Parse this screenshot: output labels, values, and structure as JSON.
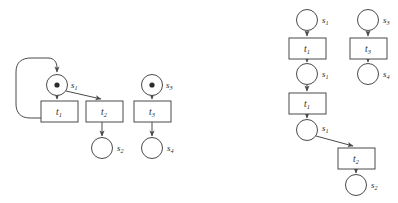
{
  "figure": {
    "name": "petri-net-and-unfolding",
    "background_color": "#ffffff",
    "line_color": "#4a4a4a",
    "text_color": "#2b2b2b",
    "width": 398,
    "height": 203
  },
  "left_net": {
    "name": "petri-net",
    "places": [
      {
        "id": "s1",
        "label": "s",
        "sub": "1",
        "cx": 57,
        "cy": 85,
        "r": 10.5,
        "tokens": 1,
        "label_x": 71,
        "label_y": 85
      },
      {
        "id": "s2",
        "label": "s",
        "sub": "2",
        "cx": 102,
        "cy": 148,
        "r": 10.5,
        "tokens": 0,
        "label_x": 117,
        "label_y": 148
      },
      {
        "id": "s3",
        "label": "s",
        "sub": "3",
        "cx": 152,
        "cy": 85,
        "r": 10.5,
        "tokens": 1,
        "label_x": 166,
        "label_y": 85
      },
      {
        "id": "s4",
        "label": "s",
        "sub": "4",
        "cx": 152,
        "cy": 148,
        "r": 10.5,
        "tokens": 0,
        "label_x": 167,
        "label_y": 148
      }
    ],
    "transitions": [
      {
        "id": "t1",
        "label": "t",
        "sub": "1",
        "x": 41,
        "y": 101,
        "w": 37,
        "h": 21
      },
      {
        "id": "t2",
        "label": "t",
        "sub": "2",
        "x": 86,
        "y": 101,
        "w": 37,
        "h": 21
      },
      {
        "id": "t3",
        "label": "t",
        "sub": "3",
        "x": 134,
        "y": 101,
        "w": 37,
        "h": 21
      }
    ],
    "arcs": [
      {
        "from": "s1",
        "to": "t1",
        "kind": "straight"
      },
      {
        "from": "s1",
        "to": "t2",
        "kind": "diagonal"
      },
      {
        "from": "t1",
        "to": "s1",
        "kind": "feedback-loop"
      },
      {
        "from": "t2",
        "to": "s2",
        "kind": "straight"
      },
      {
        "from": "s3",
        "to": "t3",
        "kind": "straight"
      },
      {
        "from": "t3",
        "to": "s4",
        "kind": "straight"
      }
    ]
  },
  "right_net": {
    "name": "unfolding-occurrence-net",
    "places": [
      {
        "id": "u_s1_a",
        "label": "s",
        "sub": "1",
        "cx": 307,
        "cy": 20,
        "r": 10.5,
        "tokens": 0,
        "label_x": 322,
        "label_y": 20
      },
      {
        "id": "u_s3",
        "label": "s",
        "sub": "3",
        "cx": 368,
        "cy": 20,
        "r": 10.5,
        "tokens": 0,
        "label_x": 383,
        "label_y": 20
      },
      {
        "id": "u_s1_b",
        "label": "s",
        "sub": "1",
        "cx": 307,
        "cy": 74,
        "r": 10.5,
        "tokens": 0,
        "label_x": 322,
        "label_y": 74
      },
      {
        "id": "u_s4",
        "label": "s",
        "sub": "4",
        "cx": 368,
        "cy": 74,
        "r": 10.5,
        "tokens": 0,
        "label_x": 383,
        "label_y": 74
      },
      {
        "id": "u_s1_c",
        "label": "s",
        "sub": "1",
        "cx": 307,
        "cy": 130,
        "r": 10.5,
        "tokens": 0,
        "label_x": 322,
        "label_y": 128
      },
      {
        "id": "u_s2",
        "label": "s",
        "sub": "2",
        "cx": 356,
        "cy": 185,
        "r": 10.5,
        "tokens": 0,
        "label_x": 371,
        "label_y": 185
      }
    ],
    "transitions": [
      {
        "id": "u_t1_a",
        "label": "t",
        "sub": "1",
        "x": 289,
        "y": 38,
        "w": 37,
        "h": 21
      },
      {
        "id": "u_t3",
        "label": "t",
        "sub": "3",
        "x": 350,
        "y": 38,
        "w": 37,
        "h": 21
      },
      {
        "id": "u_t1_b",
        "label": "t",
        "sub": "1",
        "x": 289,
        "y": 93,
        "w": 37,
        "h": 21
      },
      {
        "id": "u_t2",
        "label": "t",
        "sub": "2",
        "x": 338,
        "y": 148,
        "w": 37,
        "h": 21
      }
    ],
    "arcs": [
      {
        "from": "u_s1_a",
        "to": "u_t1_a",
        "kind": "straight"
      },
      {
        "from": "u_t1_a",
        "to": "u_s1_b",
        "kind": "straight"
      },
      {
        "from": "u_s1_b",
        "to": "u_t1_b",
        "kind": "straight"
      },
      {
        "from": "u_t1_b",
        "to": "u_s1_c",
        "kind": "straight"
      },
      {
        "from": "u_s1_c",
        "to": "u_t2",
        "kind": "diagonal"
      },
      {
        "from": "u_t2",
        "to": "u_s2",
        "kind": "straight"
      },
      {
        "from": "u_s3",
        "to": "u_t3",
        "kind": "straight"
      },
      {
        "from": "u_t3",
        "to": "u_s4",
        "kind": "straight"
      }
    ]
  }
}
